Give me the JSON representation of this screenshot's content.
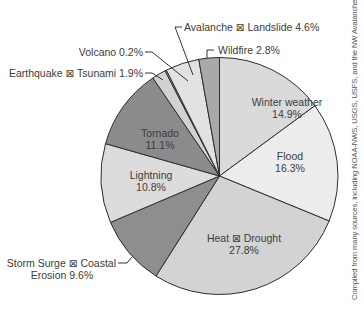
{
  "chart_data": {
    "type": "pie",
    "title": "",
    "start_angle_deg": 0,
    "direction": "clockwise",
    "unit": "%",
    "slices": [
      {
        "label": "Winter weather",
        "value": 14.9,
        "color": "#dadada"
      },
      {
        "label": "Flood",
        "value": 16.3,
        "color": "#ededed"
      },
      {
        "label": "Heat ⊠ Drought",
        "value": 27.8,
        "color": "#d3d3d3"
      },
      {
        "label": "Storm Surge ⊠ Coastal Erosion",
        "value": 9.6,
        "color": "#8e8e8e"
      },
      {
        "label": "Lightning",
        "value": 10.8,
        "color": "#dcdcdc"
      },
      {
        "label": "Tornado",
        "value": 11.1,
        "color": "#8b8b8b"
      },
      {
        "label": "Earthquake ⊠ Tsunami",
        "value": 1.9,
        "color": "#d2d2d2"
      },
      {
        "label": "Volcano",
        "value": 0.2,
        "color": "#bcbcbc"
      },
      {
        "label": "Avalanche ⊠ Landslide",
        "value": 4.6,
        "color": "#e2e2e2"
      },
      {
        "label": "Wildfire",
        "value": 2.8,
        "color": "#a9a9a9"
      }
    ],
    "credit": "Compiled from many sources, including NOAA-NWS, USGS, USFS, and the NW Avalanche Center"
  },
  "labels": {
    "winter": {
      "name": "Winter weather",
      "pct": "14.9%"
    },
    "flood": {
      "name": "Flood",
      "pct": "16.3%"
    },
    "heat": {
      "name": "Heat ⊠ Drought",
      "pct": "27.8%"
    },
    "storm": {
      "line1": "Storm Surge ⊠ Coastal",
      "line2": "Erosion 9.6%"
    },
    "lightning": {
      "name": "Lightning",
      "pct": "10.8%"
    },
    "tornado": {
      "name": "Tornado",
      "pct": "11.1%"
    },
    "earthquake": "Earthquake ⊠ Tsunami 1.9%",
    "volcano": "Volcano 0.2%",
    "avalanche": "Avalanche ⊠ Landslide 4.6%",
    "wildfire": "Wildfire 2.8%"
  },
  "credit": "Compiled from many sources, including NOAA-NWS, USGS, USFS, and the NW Avalanche Center"
}
